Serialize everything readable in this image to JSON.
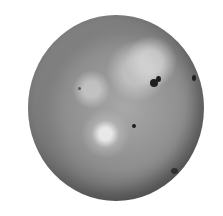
{
  "image": {
    "subject": "moon",
    "description": "Grayscale photograph of a cratered moon on white background",
    "colors": {
      "background": "#ffffff",
      "surface": "#8e8e8e",
      "dark_spots": "#1e1e1e"
    }
  }
}
